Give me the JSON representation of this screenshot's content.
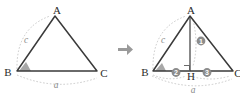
{
  "figure": {
    "arrow": {
      "name": "transform-arrow",
      "glyph": "→"
    },
    "left_triangle": {
      "caption": "Triangle ABC with angle B marked",
      "vertices": [
        {
          "label": "A",
          "x": 57,
          "y": 11
        },
        {
          "label": "B",
          "x": 9,
          "y": 72
        },
        {
          "label": "C",
          "x": 102,
          "y": 73
        }
      ],
      "side_labels": [
        {
          "label": "c",
          "x": 26,
          "y": 40
        },
        {
          "label": "a",
          "x": 56,
          "y": 84
        }
      ],
      "angle_marker": {
        "name": "angle-b-marker",
        "vertex": "B"
      }
    },
    "right_triangle": {
      "caption": "Triangle ABC with altitude AH to foot H on BC",
      "vertices": [
        {
          "label": "A",
          "x": 190,
          "y": 11
        },
        {
          "label": "B",
          "x": 146,
          "y": 72
        },
        {
          "label": "C",
          "x": 236,
          "y": 73
        },
        {
          "label": "H",
          "x": 188,
          "y": 76
        }
      ],
      "side_labels": [
        {
          "label": "c",
          "x": 163,
          "y": 40
        },
        {
          "label": "a",
          "x": 193,
          "y": 90
        }
      ],
      "segment_markers": [
        {
          "number": "1",
          "name": "segment-marker-1",
          "x": 201,
          "y": 41
        },
        {
          "number": "2",
          "name": "segment-marker-2",
          "x": 176,
          "y": 72
        },
        {
          "number": "3",
          "name": "segment-marker-3",
          "x": 207,
          "y": 72
        }
      ],
      "right_angle": {
        "name": "right-angle-marker",
        "vertex": "H"
      },
      "angle_marker": {
        "name": "angle-b-marker",
        "vertex": "B"
      }
    },
    "colors": {
      "stroke": "#3a3a3a",
      "arc": "#b4b4b4",
      "marker_fill": "#8c8c8c",
      "angle_fill": "#a8a8a8",
      "text": "#2b2b2b",
      "italic_text": "#8a8a8a",
      "background": "#ffffff"
    }
  }
}
